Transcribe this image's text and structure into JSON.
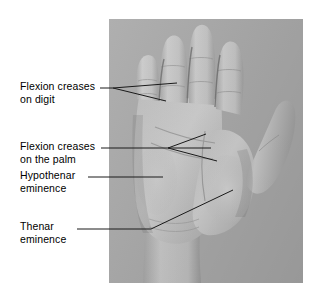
{
  "figure": {
    "background_color": "#ffffff",
    "photo": {
      "name": "hand-palm-photograph",
      "background_color": "#a9a9a9",
      "skin_color": "#c4c4c4",
      "x": 109,
      "y": 19,
      "width": 194,
      "height": 264
    }
  },
  "labels": [
    {
      "id": "flexion-creases-digit",
      "text": "Flexion creases\non digit",
      "line1": "Flexion creases",
      "line2": "on digit"
    },
    {
      "id": "flexion-creases-palm",
      "text": "Flexion creases\non the palm",
      "line1": "Flexion creases",
      "line2": "on the palm"
    },
    {
      "id": "hypothenar-eminence",
      "text": "Hypothenar\neminence",
      "line1": "Hypothenar",
      "line2": "eminence"
    },
    {
      "id": "thenar-eminence",
      "text": "Thenar\neminence",
      "line1": "Thenar",
      "line2": "eminence"
    }
  ],
  "leader_lines": {
    "color": "#1a1a1a",
    "stroke_width": 1,
    "digit": {
      "stem": "M100,88 L113,88",
      "branch_upper": "M113,88 L177,83",
      "branch_lower": "M113,88 L166,101"
    },
    "palm": {
      "stem": "M101,148 L168,148",
      "branch_upper": "M168,148 L206,134",
      "branch_middle": "M168,148 L211,148",
      "branch_lower": "M168,148 L217,161"
    },
    "hypothenar": {
      "stem": "M88,177 L163,177"
    },
    "thenar": {
      "stem": "M77,229 L151,229",
      "diagonal": "M151,229 L233,190"
    }
  }
}
